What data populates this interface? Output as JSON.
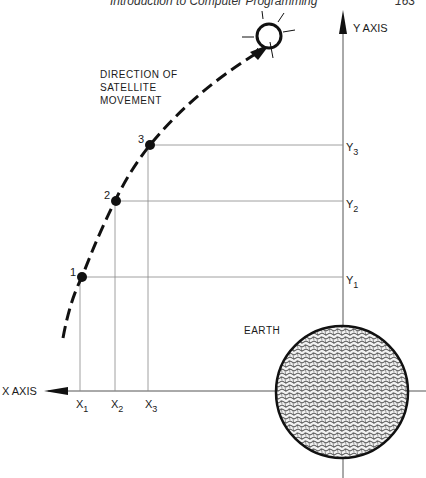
{
  "header": {
    "title": "Introduction to Computer Programming",
    "page_number": "163"
  },
  "diagram": {
    "direction_label": [
      "DIRECTION OF",
      "SATELLITE",
      "MOVEMENT"
    ],
    "y_axis_label": "Y AXIS",
    "x_axis_label": "X AXIS",
    "earth_label": "EARTH",
    "points": [
      {
        "label": "1",
        "x_label": "X",
        "x_sub": "1",
        "y_label": "Y",
        "y_sub": "1"
      },
      {
        "label": "2",
        "x_label": "X",
        "x_sub": "2",
        "y_label": "Y",
        "y_sub": "2"
      },
      {
        "label": "3",
        "x_label": "X",
        "x_sub": "3",
        "y_label": "Y",
        "y_sub": "3"
      }
    ]
  }
}
